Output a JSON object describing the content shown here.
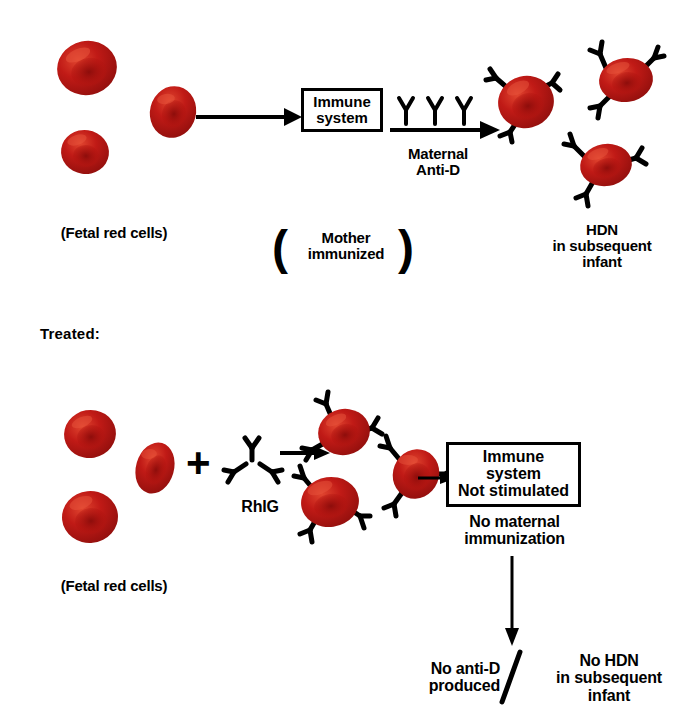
{
  "figure": {
    "title_implicit": "Rh immunization and RhIG prophylaxis",
    "colors": {
      "rbc_fill": "#b81414",
      "rbc_shadow": "#7d0c0c",
      "rbc_highlight": "#d63a2a",
      "ink": "#000000",
      "background": "#ffffff"
    }
  },
  "untreated": {
    "fetal_cells_label": "(Fetal red cells)",
    "immune_box_text": "Immune\nsystem",
    "mother_label": "Mother\nimmunized",
    "mother_paren_open": "(",
    "mother_paren_close": ")",
    "antibody_arrow_label": "Maternal\nAnti-D",
    "antibody_count": 3,
    "outcome_label": "HDN\nin subsequent\ninfant",
    "fetal_cell_count": 3,
    "coated_cell_count": 3
  },
  "treated": {
    "section_label": "Treated:",
    "fetal_cells_label": "(Fetal red cells)",
    "plus_sign": "+",
    "rhig_label": "RhIG",
    "immune_box_text": "Immune\nsystem\nNot stimulated",
    "no_immunization_label": "No maternal\nimmunization",
    "outcome_left": "No anti-D\nproduced",
    "outcome_right": "No HDN\nin subsequent\ninfant",
    "divider_glyph": "/",
    "fetal_cell_count": 3,
    "coated_cell_count": 3
  }
}
